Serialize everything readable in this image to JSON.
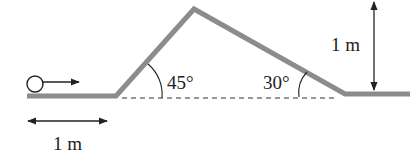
{
  "diagram": {
    "type": "physics-track",
    "labels": {
      "angle_up": "45°",
      "angle_down": "30°",
      "horizontal_distance": "1 m",
      "height_drop": "1 m"
    },
    "colors": {
      "track": "#8c8c8c",
      "ink": "#222222",
      "background": "#ffffff"
    },
    "elements": {
      "ball": "circle",
      "velocity_arrow": "right-arrow",
      "baseline": "dashed-line",
      "distance_marker": "double-headed-horizontal-arrow",
      "height_marker": "double-headed-vertical-arrow"
    }
  }
}
